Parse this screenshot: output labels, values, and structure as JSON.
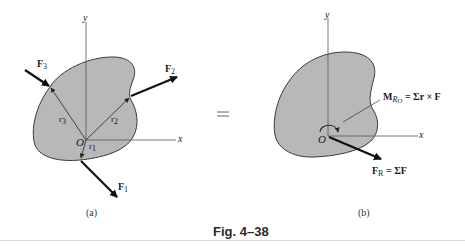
{
  "figure": {
    "caption": "Fig. 4–38",
    "panel_a": {
      "sublabel": "(a)",
      "axis_x": "x",
      "axis_y": "y",
      "origin": "O",
      "forces": [
        {
          "name": "F",
          "sub": "1"
        },
        {
          "name": "F",
          "sub": "2"
        },
        {
          "name": "F",
          "sub": "3"
        }
      ],
      "position_vectors": [
        {
          "name": "r",
          "sub": "1"
        },
        {
          "name": "r",
          "sub": "2"
        },
        {
          "name": "r",
          "sub": "3"
        }
      ]
    },
    "equals_sign": "=",
    "panel_b": {
      "sublabel": "(b)",
      "axis_x": "x",
      "axis_y": "y",
      "origin": "O",
      "moment_label": "M",
      "moment_sub": "R",
      "moment_sub2": "O",
      "moment_equation": " = Σr × F",
      "resultant_label": "F",
      "resultant_sub": "R",
      "resultant_equation": " = ΣF"
    },
    "colors": {
      "body_fill": "#b8b8b8",
      "body_stroke": "#3a3a3a",
      "axis": "#555555",
      "arrow": "#111111"
    }
  }
}
